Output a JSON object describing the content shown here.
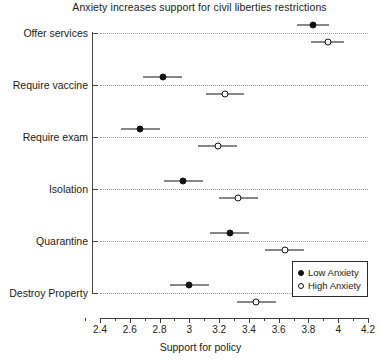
{
  "chart_data": {
    "type": "scatter",
    "title": "Anxiety increases support for civil liberties restrictions",
    "xlabel": "Support for policy",
    "ylabel": "",
    "xlim": [
      2.35,
      4.3
    ],
    "grid": true,
    "legend_position": "bottom-right",
    "categories": [
      "Offer services",
      "Require vaccine",
      "Require exam",
      "Isolation",
      "Quarantine",
      "Destroy Property"
    ],
    "xticks": [
      2.4,
      2.6,
      2.8,
      3,
      3.2,
      3.4,
      3.6,
      3.8,
      4,
      4.2
    ],
    "xticklabels": [
      "2.4",
      "2.6",
      "2.8",
      "3",
      "3.2",
      "3.4",
      "3.6",
      "3.8",
      "4",
      "4.2"
    ],
    "series": [
      {
        "name": "Low Anxiety",
        "marker": "filled-circle",
        "color": "#111111",
        "values": [
          3.83,
          2.82,
          2.67,
          2.96,
          3.27,
          3.0
        ],
        "ci_low": [
          3.72,
          2.69,
          2.54,
          2.83,
          3.14,
          2.87
        ],
        "ci_high": [
          3.94,
          2.95,
          2.8,
          3.09,
          3.4,
          3.13
        ]
      },
      {
        "name": "High Anxiety",
        "marker": "open-circle",
        "color": "#111111",
        "values": [
          3.93,
          3.24,
          3.19,
          3.33,
          3.64,
          3.45
        ],
        "ci_low": [
          3.82,
          3.11,
          3.06,
          3.2,
          3.51,
          3.32
        ],
        "ci_high": [
          4.04,
          3.37,
          3.32,
          3.46,
          3.77,
          3.58
        ]
      }
    ]
  },
  "legend": {
    "items": [
      {
        "label": "Low Anxiety",
        "marker": "filled-circle"
      },
      {
        "label": "High Anxiety",
        "marker": "open-circle"
      }
    ]
  }
}
